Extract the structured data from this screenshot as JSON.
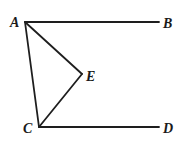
{
  "diagram": {
    "type": "geometry",
    "stroke_color": "#1e1e1e",
    "points": {
      "A": {
        "label": "A",
        "x": 25,
        "y": 22,
        "label_x": 10,
        "label_y": 27
      },
      "B": {
        "label": "B",
        "x": 159,
        "y": 22,
        "label_x": 163,
        "label_y": 28
      },
      "E": {
        "label": "E",
        "x": 82,
        "y": 74,
        "label_x": 86,
        "label_y": 81
      },
      "C": {
        "label": "C",
        "x": 39,
        "y": 127,
        "label_x": 23,
        "label_y": 133
      },
      "D": {
        "label": "D",
        "x": 159,
        "y": 127,
        "label_x": 163,
        "label_y": 133
      }
    },
    "segments": [
      {
        "from": "A",
        "to": "B"
      },
      {
        "from": "A",
        "to": "C"
      },
      {
        "from": "A",
        "to": "E"
      },
      {
        "from": "E",
        "to": "C"
      },
      {
        "from": "C",
        "to": "D"
      }
    ]
  }
}
